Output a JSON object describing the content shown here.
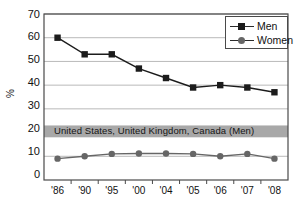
{
  "chart_data": {
    "type": "line",
    "title": "",
    "subtitle": "",
    "xlabel": "",
    "ylabel": "%",
    "ylim": [
      0,
      70
    ],
    "yticks": [
      0,
      10,
      20,
      30,
      40,
      50,
      60,
      70
    ],
    "grid": true,
    "legend_position": "top-right",
    "categories": [
      "'86",
      "'90",
      "'95",
      "'00",
      "'04",
      "'05",
      "'06",
      "'07",
      "'08"
    ],
    "series": [
      {
        "name": "Men",
        "marker": "square",
        "color": "#1c1c1c",
        "values": [
          60,
          53,
          53,
          47,
          43,
          39,
          40,
          39,
          37
        ]
      },
      {
        "name": "Women",
        "marker": "circle",
        "color": "#666666",
        "values": [
          9,
          10,
          11,
          11.2,
          11.2,
          11,
          10,
          11,
          9
        ]
      }
    ],
    "annotations": [
      {
        "type": "hband",
        "label": "United States, United Kingdom, Canada (Men)",
        "y_low": 18,
        "y_high": 23,
        "color": "#a8a8a8"
      }
    ]
  },
  "legend": {
    "entries": [
      {
        "label": "Men"
      },
      {
        "label": "Women"
      }
    ]
  },
  "axis": {
    "y_title": "%",
    "y_tick_labels": [
      "70",
      "60",
      "50",
      "40",
      "30",
      "20",
      "10",
      "0"
    ],
    "x_tick_labels": [
      "'86",
      "'90",
      "'95",
      "'00",
      "'04",
      "'05",
      "'06",
      "'07",
      "'08"
    ]
  },
  "band": {
    "text": "United States, United Kingdom, Canada (Men)"
  },
  "colors": {
    "men": "#1c1c1c",
    "women": "#666666",
    "band": "#a8a8a8",
    "grid": "#b9b9b9",
    "frame": "#4a4a4a",
    "background": "#ffffff"
  }
}
